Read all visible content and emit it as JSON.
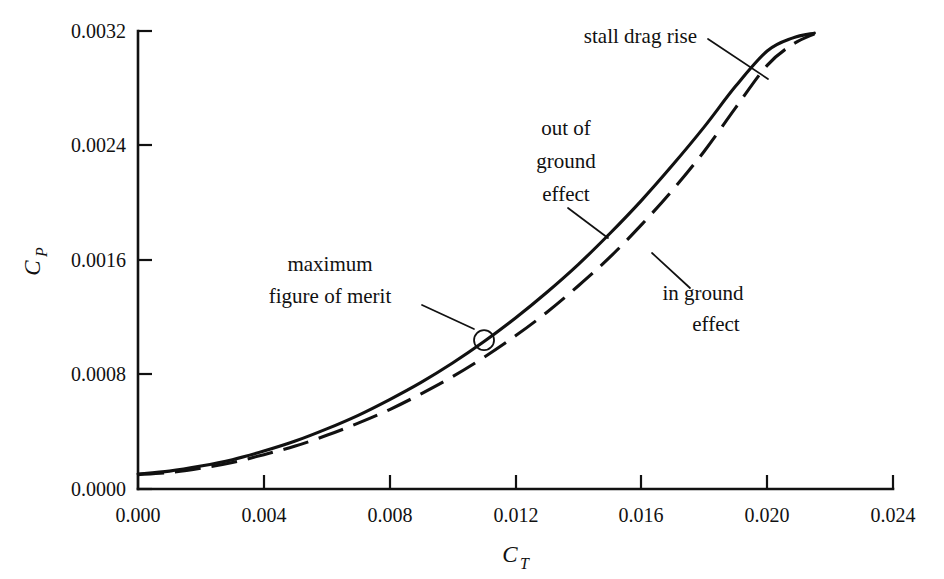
{
  "chart_data": {
    "type": "line",
    "title": "",
    "xlabel": "C_T",
    "ylabel": "C_P",
    "xlim": [
      0.0,
      0.024
    ],
    "ylim": [
      0.0,
      0.0032
    ],
    "grid": false,
    "legend": "none (inline annotations)",
    "x_ticks": [
      0.0,
      0.004,
      0.008,
      0.012,
      0.016,
      0.02,
      0.024
    ],
    "y_ticks": [
      0.0,
      0.0008,
      0.0016,
      0.0024,
      0.0032
    ],
    "x_tick_labels": [
      "0.000",
      "0.004",
      "0.008",
      "0.012",
      "0.016",
      "0.020",
      "0.024"
    ],
    "y_tick_labels": [
      "0.0000",
      "0.0008",
      "0.0016",
      "0.0024",
      "0.0032"
    ],
    "series": [
      {
        "name": "out of ground effect",
        "style": "solid",
        "x": [
          0.0,
          0.001,
          0.002,
          0.003,
          0.004,
          0.005,
          0.006,
          0.007,
          0.008,
          0.009,
          0.01,
          0.011,
          0.012,
          0.013,
          0.014,
          0.015,
          0.016,
          0.017,
          0.018,
          0.019,
          0.02,
          0.0208,
          0.0215
        ],
        "y": [
          0.000105,
          0.000125,
          0.00016,
          0.000205,
          0.000265,
          0.000335,
          0.00042,
          0.000515,
          0.000625,
          0.000745,
          0.00088,
          0.00103,
          0.001195,
          0.001375,
          0.00157,
          0.001785,
          0.002015,
          0.002265,
          0.00253,
          0.002815,
          0.00306,
          0.00315,
          0.003185
        ]
      },
      {
        "name": "in ground effect",
        "style": "dashed",
        "x": [
          0.0,
          0.001,
          0.002,
          0.003,
          0.004,
          0.005,
          0.006,
          0.007,
          0.008,
          0.009,
          0.01,
          0.011,
          0.012,
          0.013,
          0.014,
          0.015,
          0.016,
          0.017,
          0.018,
          0.019,
          0.02,
          0.0208,
          0.0215
        ],
        "y": [
          0.0001,
          0.000115,
          0.000145,
          0.000185,
          0.00024,
          0.0003,
          0.000375,
          0.00046,
          0.000555,
          0.000665,
          0.000785,
          0.00092,
          0.00107,
          0.001235,
          0.00142,
          0.00162,
          0.001845,
          0.00209,
          0.00236,
          0.002665,
          0.00296,
          0.003105,
          0.00318
        ]
      }
    ],
    "markers": [
      {
        "name": "maximum figure of merit",
        "shape": "open-circle",
        "x": 0.011,
        "y": 0.00104
      }
    ],
    "annotations": [
      {
        "id": "stall-drag-rise",
        "text": "stall drag rise",
        "lines": [
          "stall drag rise"
        ]
      },
      {
        "id": "out-of-ground-effect",
        "text": "out of ground effect",
        "lines": [
          "out of",
          "ground",
          "effect"
        ]
      },
      {
        "id": "in-ground-effect",
        "text": "in ground effect",
        "lines": [
          "in ground",
          "effect"
        ]
      },
      {
        "id": "maximum-figure-of-merit",
        "text": "maximum figure of merit",
        "lines": [
          "maximum",
          "figure of merit"
        ]
      }
    ]
  },
  "axes": {
    "y_title_base": "C",
    "y_title_sub": "P",
    "x_title_base": "C",
    "x_title_sub": "T"
  },
  "ticks": {
    "x": [
      "0.000",
      "0.004",
      "0.008",
      "0.012",
      "0.016",
      "0.020",
      "0.024"
    ],
    "y": [
      "0.0032",
      "0.0024",
      "0.0016",
      "0.0008",
      "0.0000"
    ]
  },
  "annotations": {
    "stall_drag_rise": "stall drag rise",
    "out_of_ground_effect_l1": "out of",
    "out_of_ground_effect_l2": "ground",
    "out_of_ground_effect_l3": "effect",
    "in_ground_effect_l1": "in ground",
    "in_ground_effect_l2": "effect",
    "maximum_figure_of_merit_l1": "maximum",
    "maximum_figure_of_merit_l2": "figure of merit"
  },
  "colors": {
    "ink": "#111111",
    "background": "#ffffff"
  }
}
